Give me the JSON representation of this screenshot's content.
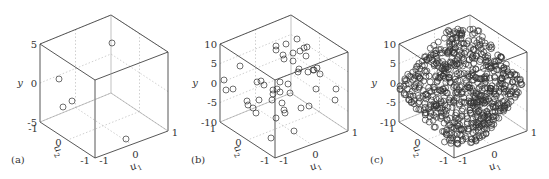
{
  "chart_data": [
    {
      "type": "scatter",
      "subtype": "3d-scatter",
      "panel_label": "(a)",
      "xlabel": "u1",
      "zlabel": "u2",
      "ylabel": "y",
      "y_ticks": [
        "5",
        "0",
        "-5"
      ],
      "ylim": [
        -5,
        5
      ],
      "u1_ticks": [
        "-1",
        "0",
        "1"
      ],
      "u2_ticks": [
        "-1",
        "0",
        "-1"
      ],
      "n_points": 5,
      "points_px": [
        [
          112,
          43
        ],
        [
          59,
          79
        ],
        [
          63,
          107
        ],
        [
          72,
          101
        ],
        [
          126,
          139
        ]
      ]
    },
    {
      "type": "scatter",
      "subtype": "3d-scatter",
      "panel_label": "(b)",
      "xlabel": "u1",
      "zlabel": "u2",
      "ylabel": "y",
      "y_ticks": [
        "10",
        "5",
        "0",
        "-5",
        "-10"
      ],
      "ylim": [
        -10,
        10
      ],
      "u1_ticks": [
        "-1",
        "0",
        "1"
      ],
      "u2_ticks": [
        "1",
        "0",
        "-1"
      ],
      "n_points": 50,
      "points_px": [
        [
          286,
          44
        ],
        [
          276,
          46
        ],
        [
          297,
          39
        ],
        [
          276,
          50
        ],
        [
          300,
          51
        ],
        [
          304,
          48
        ],
        [
          307,
          47
        ],
        [
          306,
          56
        ],
        [
          293,
          53
        ],
        [
          283,
          55
        ],
        [
          284,
          59
        ],
        [
          293,
          61
        ],
        [
          240,
          66
        ],
        [
          299,
          69
        ],
        [
          308,
          72
        ],
        [
          313,
          70
        ],
        [
          317,
          68
        ],
        [
          314,
          70
        ],
        [
          320,
          74
        ],
        [
          298,
          72
        ],
        [
          224,
          80
        ],
        [
          257,
          82
        ],
        [
          261,
          81
        ],
        [
          264,
          85
        ],
        [
          280,
          82
        ],
        [
          280,
          92
        ],
        [
          288,
          84
        ],
        [
          277,
          89
        ],
        [
          273,
          90
        ],
        [
          290,
          93
        ],
        [
          233,
          89
        ],
        [
          316,
          89
        ],
        [
          336,
          89
        ],
        [
          273,
          94
        ],
        [
          247,
          101
        ],
        [
          259,
          100
        ],
        [
          272,
          100
        ],
        [
          282,
          103
        ],
        [
          248,
          105
        ],
        [
          253,
          108
        ],
        [
          256,
          113
        ],
        [
          284,
          110
        ],
        [
          285,
          113
        ],
        [
          301,
          108
        ],
        [
          309,
          106
        ],
        [
          335,
          100
        ],
        [
          276,
          118
        ],
        [
          294,
          131
        ],
        [
          271,
          138
        ],
        [
          226,
          90
        ]
      ]
    },
    {
      "type": "scatter",
      "subtype": "3d-scatter",
      "panel_label": "(c)",
      "xlabel": "u1",
      "zlabel": "u2",
      "ylabel": "y",
      "y_ticks": [
        "10",
        "5",
        "0",
        "-5",
        "-10"
      ],
      "ylim": [
        -10,
        10
      ],
      "u1_ticks": [
        "-1",
        "0",
        "1"
      ],
      "u2_ticks": [
        "1",
        "0",
        "-1"
      ],
      "n_points": 700,
      "cloud": {
        "cx": 462,
        "cy": 87,
        "rx": 62,
        "ry": 58,
        "seed": 7
      }
    }
  ],
  "panels": [
    {
      "label": "(a)",
      "offset": 0,
      "y_ticks": [
        "5",
        "0",
        "-5"
      ],
      "u2_ticks": [
        "-1",
        "0",
        "-1"
      ],
      "u1_ticks": [
        "-1",
        "0",
        "1"
      ]
    },
    {
      "label": "(b)",
      "offset": 180,
      "y_ticks": [
        "10",
        "5",
        "0",
        "-5",
        "-10"
      ],
      "u2_ticks": [
        "1",
        "0",
        "-1"
      ],
      "u1_ticks": [
        "-1",
        "0",
        "1"
      ]
    },
    {
      "label": "(c)",
      "offset": 359,
      "y_ticks": [
        "10",
        "5",
        "0",
        "-5",
        "-10"
      ],
      "u2_ticks": [
        "1",
        "0",
        "-1"
      ],
      "u1_ticks": [
        "-1",
        "0",
        "1"
      ]
    }
  ],
  "axis_names": {
    "y": "y",
    "u1": "u",
    "u1_sub": "1",
    "u2": "u",
    "u2_sub": "2"
  }
}
